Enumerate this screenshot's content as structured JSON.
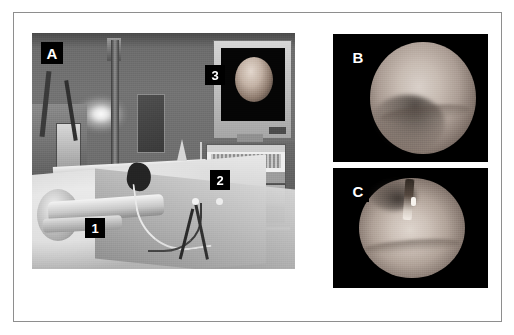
{
  "figure": {
    "width": 514,
    "height": 335,
    "background_color": "#ffffff",
    "frame_color": "#8e8e8e",
    "label_background": "#000000",
    "label_text_color": "#ffffff"
  },
  "panels": {
    "a": {
      "label": "A",
      "kind": "photograph",
      "description": "operating room setup photograph",
      "callouts": [
        {
          "label": "1",
          "name": "callout-1"
        },
        {
          "label": "2",
          "name": "callout-2"
        },
        {
          "label": "3",
          "name": "callout-3"
        }
      ]
    },
    "b": {
      "label": "B",
      "kind": "endoscopic-image",
      "description": "endoscopic view, circular field"
    },
    "c": {
      "label": "C",
      "kind": "endoscopic-image",
      "description": "endoscopic view with instrument entering from top"
    }
  }
}
